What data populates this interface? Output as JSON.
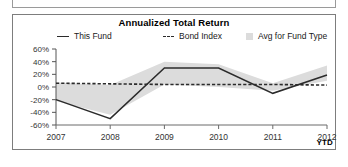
{
  "panel": {
    "title": "Annualized Total Return",
    "ytd_label": "YTD"
  },
  "legend": {
    "items": [
      {
        "label": "This Fund",
        "marker": "solid-line",
        "color": "#2b2b2b"
      },
      {
        "label": "Bond Index",
        "marker": "dashed-line",
        "color": "#2b2b2b"
      },
      {
        "label": "Avg for Fund Type",
        "marker": "filled-square",
        "color": "#dcdcdc"
      }
    ]
  },
  "chart_data": {
    "type": "line",
    "title": "Annualized Total Return",
    "xlabel": "",
    "ylabel": "",
    "categories": [
      "2007",
      "2008",
      "2009",
      "2010",
      "2011",
      "2012"
    ],
    "x_tick_labels": [
      "2007",
      "2008",
      "2009",
      "2010",
      "2011",
      "2012"
    ],
    "x_axis_note": "YTD",
    "y_tick_labels": [
      "60%",
      "40%",
      "20%",
      "0%",
      "-20%",
      "-40%",
      "-60%"
    ],
    "y_tick_values": [
      60,
      40,
      20,
      0,
      -20,
      -40,
      -60
    ],
    "ylim": [
      -60,
      60
    ],
    "grid": false,
    "legend_position": "top",
    "series": [
      {
        "name": "This Fund",
        "style": "solid",
        "color": "#2b2b2b",
        "values": [
          -20,
          -50,
          30,
          30,
          -10,
          19
        ]
      },
      {
        "name": "Bond Index",
        "style": "dashed",
        "color": "#2b2b2b",
        "values": [
          6,
          5,
          4,
          4,
          4,
          3
        ]
      },
      {
        "name": "Avg for Fund Type",
        "style": "band",
        "color": "#dcdcdc",
        "band_upper": [
          7,
          3,
          40,
          36,
          6,
          34
        ],
        "band_lower": [
          -22,
          -44,
          4,
          0,
          -6,
          10
        ]
      }
    ]
  }
}
